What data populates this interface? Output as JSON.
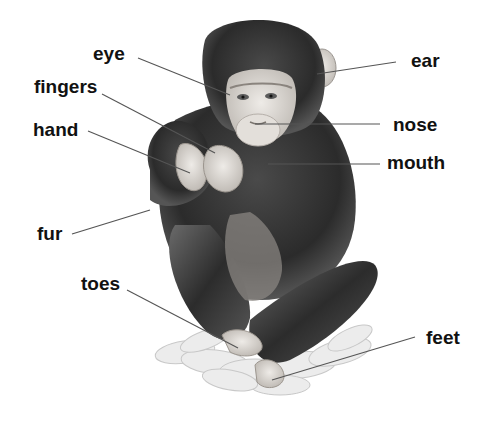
{
  "diagram": {
    "labels": [
      {
        "id": "eye",
        "text": "eye",
        "x": 93,
        "y": 50,
        "line": [
          138,
          58,
          230,
          95
        ]
      },
      {
        "id": "fingers",
        "text": "fingers",
        "x": 34,
        "y": 82,
        "line": [
          102,
          94,
          215,
          153
        ]
      },
      {
        "id": "hand",
        "text": "hand",
        "x": 33,
        "y": 123,
        "line": [
          88,
          131,
          190,
          173
        ]
      },
      {
        "id": "fur",
        "text": "fur",
        "x": 37,
        "y": 227,
        "line": [
          72,
          234,
          150,
          210
        ]
      },
      {
        "id": "toes",
        "text": "toes",
        "x": 81,
        "y": 277,
        "line": [
          127,
          290,
          238,
          348
        ]
      },
      {
        "id": "ear",
        "text": "ear",
        "x": 411,
        "y": 53,
        "line": [
          396,
          62,
          317,
          74
        ]
      },
      {
        "id": "nose",
        "text": "nose",
        "x": 393,
        "y": 116,
        "line": [
          380,
          124,
          255,
          124
        ]
      },
      {
        "id": "mouth",
        "text": "mouth",
        "x": 387,
        "y": 155,
        "line": [
          380,
          164,
          268,
          164
        ]
      },
      {
        "id": "feet",
        "text": "feet",
        "x": 426,
        "y": 331,
        "line": [
          415,
          337,
          272,
          380
        ]
      }
    ],
    "colors": {
      "label_text": "#111111",
      "leader_line": "#555555",
      "fur_dark": "#2a2a2a",
      "fur_mid": "#5a5a5a",
      "skin": "#d8d4cf",
      "leaves": "#e4e4e4"
    }
  }
}
